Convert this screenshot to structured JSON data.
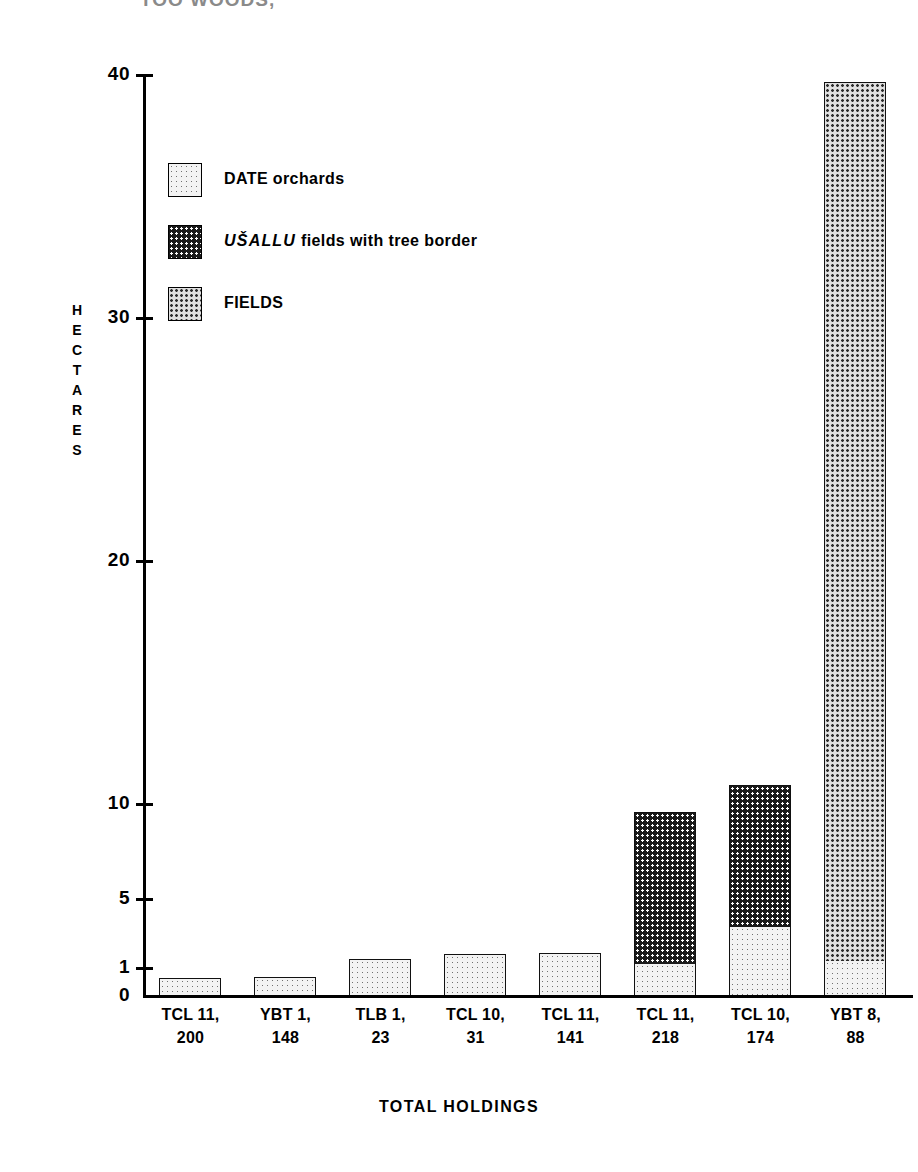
{
  "top_fragment": "TOO  WOODS,",
  "axis": {
    "y_title_letters": [
      "H",
      "E",
      "C",
      "T",
      "A",
      "R",
      "E",
      "S"
    ],
    "y_title": "HECTARES",
    "y_ticks": [
      "40",
      "30",
      "20",
      "10",
      "5",
      "1",
      "0"
    ],
    "x_title": "TOTAL HOLDINGS"
  },
  "legend": {
    "items": [
      {
        "name": "date-orchards",
        "label": "DATE orchards",
        "label_plain": "DATE orchards",
        "pattern": "pat-date",
        "color": "#f3f3f3"
      },
      {
        "name": "usallu-fields",
        "label_italic": "UŠALLU",
        "label_rest": " fields with tree border",
        "label_plain": "UŠALLU fields with tree border",
        "pattern": "pat-usallu",
        "color": "#1a1a1a"
      },
      {
        "name": "fields",
        "label": "FIELDS",
        "label_plain": "FIELDS",
        "pattern": "pat-fields",
        "color": "#e0e0e0"
      }
    ]
  },
  "chart_data": {
    "type": "bar",
    "title": "",
    "subtitle": "",
    "xlabel": "TOTAL HOLDINGS",
    "ylabel": "HECTARES",
    "stacked": true,
    "grid": false,
    "legend_position": "inside-upper-left",
    "y_scale": "nonlinear-broken",
    "y_ticks": [
      0,
      1,
      5,
      10,
      20,
      30,
      40
    ],
    "ylim": [
      0,
      40
    ],
    "categories": [
      "TCL 11, 200",
      "YBT 1, 148",
      "TLB 1, 23",
      "TCL 10, 31",
      "TCL 11, 141",
      "TCL 11, 218",
      "TCL 10, 174",
      "YBT 8, 88"
    ],
    "category_lines": [
      [
        "TCL 11,",
        "200"
      ],
      [
        "YBT 1,",
        "148"
      ],
      [
        "TLB 1,",
        "23"
      ],
      [
        "TCL 10,",
        "31"
      ],
      [
        "TCL 11,",
        "141"
      ],
      [
        "TCL 11,",
        "218"
      ],
      [
        "TCL 10,",
        "174"
      ],
      [
        "YBT 8,",
        "88"
      ]
    ],
    "series": [
      {
        "name": "DATE orchards",
        "pattern": "pat-date",
        "values": [
          0.55,
          0.6,
          1.35,
          1.55,
          1.6,
          1.2,
          2.9,
          1.4
        ]
      },
      {
        "name": "UŠALLU fields with tree border",
        "pattern": "pat-usallu",
        "values": [
          0,
          0,
          0,
          0,
          0,
          10.6,
          10.5,
          0
        ]
      },
      {
        "name": "FIELDS",
        "pattern": "pat-fields",
        "values": [
          0,
          0,
          0,
          0,
          0,
          0,
          0,
          38.3
        ]
      }
    ],
    "totals": [
      0.55,
      0.6,
      1.35,
      1.55,
      1.6,
      11.8,
      13.4,
      39.7
    ]
  },
  "geometry": {
    "tick_y_px": {
      "40": 74,
      "30": 317,
      "20": 560,
      "10": 803,
      "5": 898,
      "1": 967,
      "0": 995
    },
    "bars": [
      {
        "x": 159,
        "w": 62,
        "segments": [
          {
            "series": 0,
            "h": 17
          }
        ]
      },
      {
        "x": 254,
        "w": 62,
        "segments": [
          {
            "series": 0,
            "h": 18
          }
        ]
      },
      {
        "x": 349,
        "w": 62,
        "segments": [
          {
            "series": 0,
            "h": 36
          }
        ]
      },
      {
        "x": 444,
        "w": 62,
        "segments": [
          {
            "series": 0,
            "h": 41
          }
        ]
      },
      {
        "x": 539,
        "w": 62,
        "segments": [
          {
            "series": 0,
            "h": 42
          }
        ]
      },
      {
        "x": 634,
        "w": 62,
        "segments": [
          {
            "series": 0,
            "h": 31
          },
          {
            "series": 1,
            "h": 152
          }
        ]
      },
      {
        "x": 729,
        "w": 62,
        "segments": [
          {
            "series": 0,
            "h": 68
          },
          {
            "series": 1,
            "h": 142
          }
        ]
      },
      {
        "x": 824,
        "w": 62,
        "segments": [
          {
            "series": 0,
            "h": 34
          },
          {
            "series": 2,
            "h": 879
          }
        ]
      }
    ]
  }
}
